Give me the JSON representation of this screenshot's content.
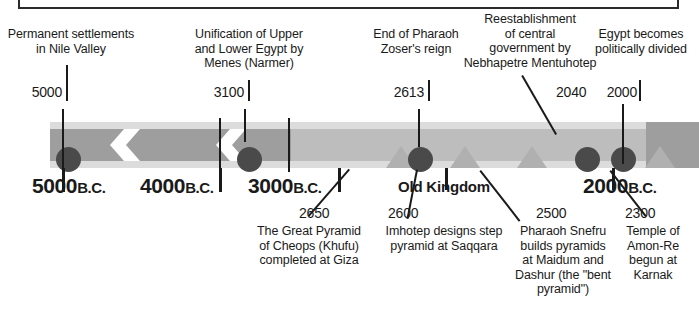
{
  "figure": {
    "colors": {
      "band_light": "#dcdcdc",
      "band_medium": "#bdbdbd",
      "band_dark": "#9e9e9e",
      "dot": "#4a4a4a",
      "pyramid": "#b0b0b0",
      "line": "#1a1a1a",
      "background": "#ffffff"
    }
  },
  "axis": {
    "ticks": [
      {
        "year": "5000",
        "era": "B.C."
      },
      {
        "year": "4000",
        "era": "B.C."
      },
      {
        "year": "3000",
        "era": "B.C."
      },
      {
        "year": "2000",
        "era": "B.C."
      }
    ],
    "period_label": "Old Kingdom"
  },
  "events_above": [
    {
      "year": "5000",
      "text_lines": [
        "Permanent settlements",
        "in Nile Valley"
      ],
      "marker": "dot"
    },
    {
      "year": "3100",
      "text_lines": [
        "Unification of Upper",
        "and Lower Egypt by",
        "Menes (Narmer)"
      ],
      "marker": "dot"
    },
    {
      "year": "2613",
      "text_lines": [
        "End of Pharaoh",
        "Zoser's reign"
      ],
      "marker": "dot"
    },
    {
      "year": "2040",
      "text_lines": [
        "Reestablishment",
        "of central",
        "government by",
        "Nebhapetre Mentuhotep"
      ],
      "marker": "dot"
    },
    {
      "year": "2000",
      "text_lines": [
        "Egypt becomes",
        "politically divided"
      ],
      "marker": "dot"
    }
  ],
  "events_below": [
    {
      "year": "2650",
      "text_lines": [
        "The Great Pyramid",
        "of Cheops (Khufu)",
        "completed at Giza"
      ],
      "marker": "pyramid"
    },
    {
      "year": "2600",
      "text_lines": [
        "Imhotep designs step",
        "pyramid at Saqqara"
      ],
      "marker": "pyramid"
    },
    {
      "year": "2500",
      "text_lines": [
        "Pharaoh Snefru",
        "builds pyramids",
        "at Maidum and",
        "Dashur (the \"bent",
        "pyramid\")"
      ],
      "marker": "pyramid"
    },
    {
      "year": "2300",
      "text_lines": [
        "Temple of",
        "Amon-Re",
        "begun at",
        "Karnak"
      ],
      "marker": "pyramid"
    }
  ]
}
